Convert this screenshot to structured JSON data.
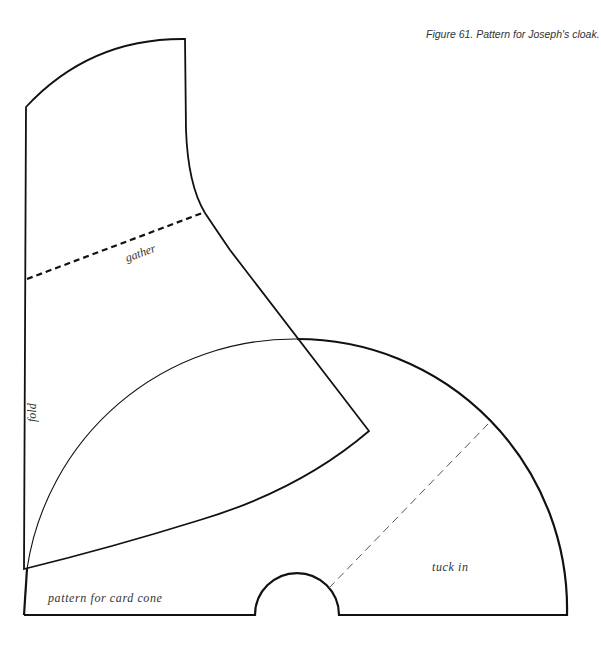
{
  "caption": "Figure 61. Pattern for Joseph's cloak.",
  "labels": {
    "gather": "gather",
    "fold": "fold",
    "card_cone": "pattern for card cone",
    "tuck_in": "tuck in"
  },
  "colors": {
    "line": "#111111",
    "text": "#333333",
    "background": "#ffffff"
  }
}
